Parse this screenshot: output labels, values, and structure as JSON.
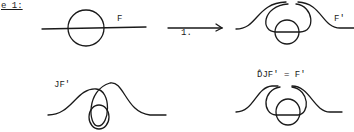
{
  "figure": {
    "caption_fragment": "e 1:",
    "panels": [
      {
        "id": "F",
        "label": "F"
      },
      {
        "id": "F-prime",
        "label": "F'"
      },
      {
        "id": "JF-prime",
        "label": "JF'"
      },
      {
        "id": "DJF-prime",
        "label": "D̂JF' = F'"
      }
    ],
    "arrow_label": "1."
  },
  "colors": {
    "ink": "#1a1a1a",
    "background": "#ffffff"
  }
}
